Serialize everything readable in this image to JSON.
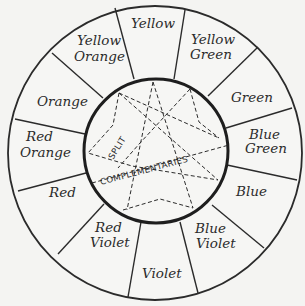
{
  "diagram": {
    "center_label": {
      "line1": "SPLIT",
      "line2": "COMPLEMENTARIES"
    },
    "segments": [
      {
        "name": "yellow",
        "lines": [
          "Yellow"
        ]
      },
      {
        "name": "yellow-green",
        "lines": [
          "Yellow",
          "Green"
        ]
      },
      {
        "name": "green",
        "lines": [
          "Green"
        ]
      },
      {
        "name": "blue-green",
        "lines": [
          "Blue",
          "Green"
        ]
      },
      {
        "name": "blue",
        "lines": [
          "Blue"
        ]
      },
      {
        "name": "blue-violet",
        "lines": [
          "Blue",
          "Violet"
        ]
      },
      {
        "name": "violet",
        "lines": [
          "Violet"
        ]
      },
      {
        "name": "red-violet",
        "lines": [
          "Red",
          "Violet"
        ]
      },
      {
        "name": "red",
        "lines": [
          "Red"
        ]
      },
      {
        "name": "red-orange",
        "lines": [
          "Red",
          "Orange"
        ]
      },
      {
        "name": "orange",
        "lines": [
          "Orange"
        ]
      },
      {
        "name": "yellow-orange",
        "lines": [
          "Yellow",
          "Orange"
        ]
      }
    ],
    "colors": {
      "ink": "#2b2b2b",
      "paper": "#f4f4f2"
    }
  }
}
